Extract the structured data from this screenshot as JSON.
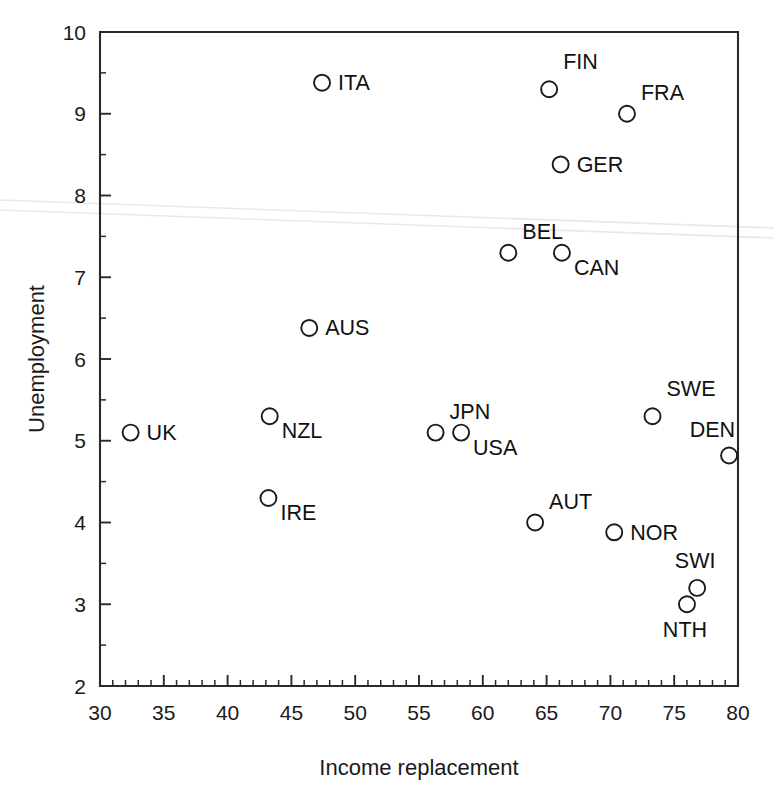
{
  "chart_data": {
    "type": "scatter",
    "title": "",
    "xlabel": "Income replacement",
    "ylabel": "Unemployment",
    "xlim": [
      30,
      80
    ],
    "ylim": [
      2,
      10
    ],
    "x_tick_labels": [
      "30",
      "35",
      "40",
      "45",
      "50",
      "55",
      "60",
      "65",
      "70",
      "75",
      "80"
    ],
    "x_ticks": [
      30,
      35,
      40,
      45,
      50,
      55,
      60,
      65,
      70,
      75,
      80
    ],
    "x_minor_step": 1,
    "y_tick_labels": [
      "2",
      "3",
      "4",
      "5",
      "6",
      "7",
      "8",
      "9",
      "10"
    ],
    "y_ticks": [
      2,
      3,
      4,
      5,
      6,
      7,
      8,
      9,
      10
    ],
    "y_minor_step": 0.5,
    "grid": false,
    "legend": "none",
    "marker_style": "open-circle",
    "points": [
      {
        "label": "UK",
        "x": 32.4,
        "y": 5.1,
        "label_pos": "right"
      },
      {
        "label": "IRE",
        "x": 43.2,
        "y": 4.3,
        "label_pos": "lower-right"
      },
      {
        "label": "NZL",
        "x": 43.3,
        "y": 5.3,
        "label_pos": "lower-right"
      },
      {
        "label": "AUS",
        "x": 46.4,
        "y": 6.38,
        "label_pos": "right"
      },
      {
        "label": "ITA",
        "x": 47.4,
        "y": 9.38,
        "label_pos": "right"
      },
      {
        "label": "JPN",
        "x": 56.3,
        "y": 5.1,
        "label_pos": "upper-right"
      },
      {
        "label": "USA",
        "x": 58.3,
        "y": 5.1,
        "label_pos": "lower-right"
      },
      {
        "label": "BEL",
        "x": 62.0,
        "y": 7.3,
        "label_pos": "upper-right"
      },
      {
        "label": "AUT",
        "x": 64.1,
        "y": 4.0,
        "label_pos": "upper-right"
      },
      {
        "label": "FIN",
        "x": 65.2,
        "y": 9.3,
        "label_pos": "above-right"
      },
      {
        "label": "CAN",
        "x": 66.2,
        "y": 7.3,
        "label_pos": "lower-right"
      },
      {
        "label": "GER",
        "x": 66.1,
        "y": 8.38,
        "label_pos": "right"
      },
      {
        "label": "NOR",
        "x": 70.3,
        "y": 3.88,
        "label_pos": "right"
      },
      {
        "label": "FRA",
        "x": 71.3,
        "y": 9.0,
        "label_pos": "upper-right"
      },
      {
        "label": "SWE",
        "x": 73.3,
        "y": 5.3,
        "label_pos": "above-right"
      },
      {
        "label": "NTH",
        "x": 76.0,
        "y": 3.0,
        "label_pos": "below"
      },
      {
        "label": "SWI",
        "x": 76.8,
        "y": 3.2,
        "label_pos": "above"
      },
      {
        "label": "DEN",
        "x": 79.3,
        "y": 4.82,
        "label_pos": "above-left"
      }
    ]
  }
}
